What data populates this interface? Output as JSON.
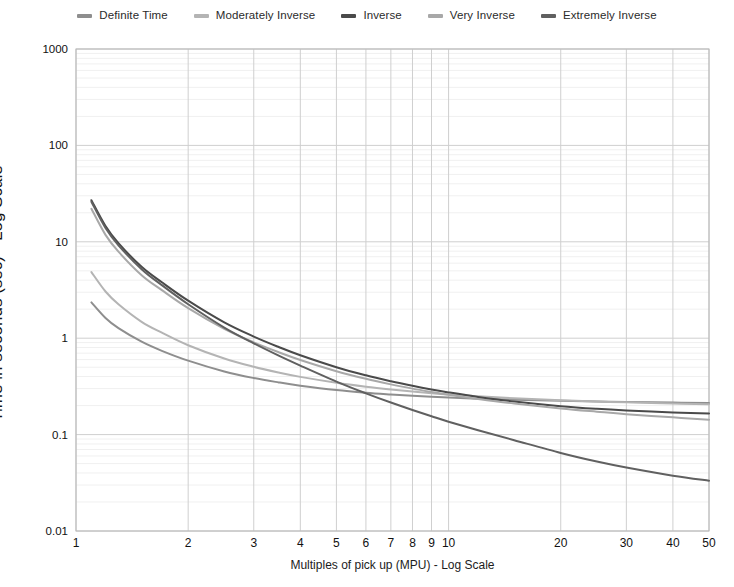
{
  "chart_data": {
    "type": "line",
    "title": "",
    "xlabel": "Multiples of pick up (MPU) - Log Scale",
    "ylabel": "Time in seconds (sec) - Log Scale",
    "xscale": "log",
    "yscale": "log",
    "xlim": [
      1,
      50
    ],
    "ylim": [
      0.01,
      1000
    ],
    "grid": true,
    "legend_position": "top-center",
    "x_ticks": [
      1,
      2,
      3,
      4,
      5,
      6,
      7,
      8,
      9,
      10,
      20,
      30,
      40,
      50
    ],
    "x_tick_labels": [
      "1",
      "2",
      "3",
      "4",
      "5",
      "6",
      "7",
      "8",
      "9",
      "10",
      "20",
      "30",
      "40",
      "50"
    ],
    "y_ticks": [
      0.01,
      0.1,
      1,
      10,
      100,
      1000
    ],
    "y_tick_labels": [
      "0.01",
      "0.1",
      "1",
      "10",
      "100",
      "1000"
    ],
    "x": [
      1.1,
      1.2,
      1.3,
      1.5,
      1.7,
      2,
      2.5,
      3,
      3.5,
      4,
      5,
      6,
      7,
      8,
      9,
      10,
      12,
      15,
      20,
      25,
      30,
      40,
      50
    ],
    "series": [
      {
        "name": "Definite Time",
        "color": "#8e8e8e",
        "values": [
          2.35,
          1.62,
          1.27,
          0.92,
          0.74,
          0.585,
          0.452,
          0.386,
          0.348,
          0.322,
          0.29,
          0.272,
          0.261,
          0.253,
          0.247,
          0.243,
          0.236,
          0.23,
          0.224,
          0.221,
          0.218,
          0.215,
          0.213
        ]
      },
      {
        "name": "Moderately Inverse",
        "color": "#b4b4b4",
        "values": [
          4.85,
          3.05,
          2.25,
          1.48,
          1.14,
          0.845,
          0.615,
          0.505,
          0.44,
          0.397,
          0.345,
          0.314,
          0.294,
          0.28,
          0.269,
          0.261,
          0.25,
          0.238,
          0.227,
          0.22,
          0.216,
          0.21,
          0.206
        ]
      },
      {
        "name": "Inverse",
        "color": "#4a4a4a",
        "values": [
          27.0,
          14.6,
          9.7,
          5.5,
          3.8,
          2.45,
          1.46,
          1.04,
          0.81,
          0.665,
          0.5,
          0.412,
          0.358,
          0.321,
          0.294,
          0.274,
          0.246,
          0.22,
          0.197,
          0.185,
          0.178,
          0.17,
          0.166
        ]
      },
      {
        "name": "Very Inverse",
        "color": "#a8a8a8",
        "values": [
          22.0,
          11.8,
          7.9,
          4.5,
          3.15,
          2.05,
          1.25,
          0.905,
          0.715,
          0.595,
          0.455,
          0.379,
          0.332,
          0.3,
          0.277,
          0.259,
          0.234,
          0.21,
          0.187,
          0.173,
          0.163,
          0.151,
          0.143
        ]
      },
      {
        "name": "Extremely Inverse",
        "color": "#606060",
        "values": [
          26.0,
          13.9,
          9.2,
          5.2,
          3.55,
          2.25,
          1.29,
          0.885,
          0.66,
          0.52,
          0.355,
          0.268,
          0.215,
          0.18,
          0.155,
          0.136,
          0.111,
          0.0875,
          0.0645,
          0.0525,
          0.0455,
          0.0375,
          0.0333
        ]
      }
    ]
  },
  "legend": {
    "items": [
      {
        "label": "Definite Time",
        "color": "#8e8e8e"
      },
      {
        "label": "Moderately Inverse",
        "color": "#b4b4b4"
      },
      {
        "label": "Inverse",
        "color": "#4a4a4a"
      },
      {
        "label": "Very Inverse",
        "color": "#a8a8a8"
      },
      {
        "label": "Extremely Inverse",
        "color": "#606060"
      }
    ]
  },
  "axes": {
    "x_title": "Multiples of pick up (MPU) - Log Scale",
    "y_title": "Time in seconds (sec) - Log Scale"
  },
  "style": {
    "background": "#ffffff",
    "grid_major": "#cfcfcf",
    "grid_minor": "#f0f0f0",
    "axis_line": "#b8b8b8",
    "text": "#111111"
  }
}
